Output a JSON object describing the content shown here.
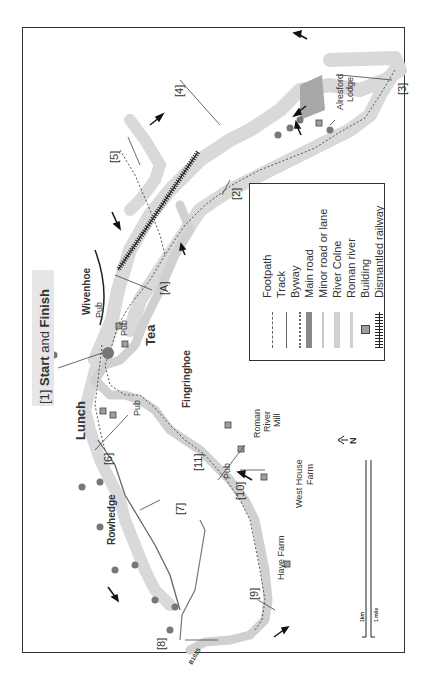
{
  "map": {
    "start_label": {
      "prefix": "[1] ",
      "bold1": "Start",
      "mid": " and ",
      "bold2": "Finish"
    },
    "places": {
      "wivenhoe": "Wivenhoe",
      "rowhedge": "Rowhedge",
      "fingringhoe": "Fingringhoe",
      "alresford_lodge_1": "Alresford",
      "alresford_lodge_2": "Lodge",
      "roman_river_mill_1": "Roman",
      "roman_river_mill_2": "River",
      "roman_river_mill_3": "Mill",
      "west_house_farm_1": "West House",
      "west_house_farm_2": "Farm",
      "haye_farm": "Haye Farm",
      "road_b1025": "B1025"
    },
    "stops": {
      "lunch": "Lunch",
      "tea": "Tea",
      "pub": "Pub"
    },
    "waypoints": [
      "[2]",
      "[3]",
      "[4]",
      "[5]",
      "[6]",
      "[7]",
      "[8]",
      "[9]",
      "[10]",
      "[11]",
      "[A]"
    ],
    "north": "N",
    "scale": {
      "km": "1km",
      "mile": "1 mile"
    }
  },
  "legend": {
    "items": [
      {
        "label": "Footpath",
        "symbol": "dotted"
      },
      {
        "label": "Track",
        "symbol": "thin-line"
      },
      {
        "label": "Byway",
        "symbol": "dense-dotted"
      },
      {
        "label": "Main road",
        "symbol": "dark-thick"
      },
      {
        "label": "Minor road or lane",
        "symbol": "light-line"
      },
      {
        "label": "River Colne",
        "symbol": "light-thick"
      },
      {
        "label": "Roman river",
        "symbol": "light-medium"
      },
      {
        "label": "Building",
        "symbol": "square"
      },
      {
        "label": "Dismantled railway",
        "symbol": "railway"
      }
    ]
  },
  "colors": {
    "river": "#d9d9d9",
    "river_edge": "#bdbdbd",
    "path": "#666666",
    "tree": "#7a7a7a",
    "building": "#9e9e9e",
    "frame": "#333333",
    "start_highlight": "#e6e6e6"
  }
}
